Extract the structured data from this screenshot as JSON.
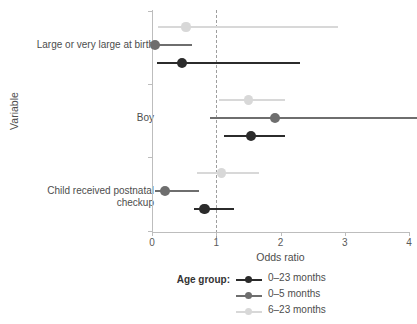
{
  "chart_data": {
    "type": "scatter",
    "title": "",
    "xlabel": "Odds ratio",
    "ylabel": "Variable",
    "xlim": [
      0,
      4.12
    ],
    "xticks": [
      0,
      1,
      2,
      3,
      4
    ],
    "xtick_labels": [
      "0",
      "1",
      "2",
      "3",
      "4"
    ],
    "reference_line": 1,
    "grid": false,
    "legend_position": "bottom",
    "legend_title": "Age group:",
    "categories": [
      "Large or very large at birth",
      "Boy",
      "Child received postnatal checkup"
    ],
    "category_labels": [
      [
        "Large or very large at birth"
      ],
      [
        "Boy"
      ],
      [
        "Child received postnatal",
        "checkup"
      ]
    ],
    "series": [
      {
        "name": "0-23 months",
        "color": "#2b2b2b",
        "estimates": [
          0.47,
          1.54,
          0.82
        ],
        "ci_low": [
          0.08,
          1.12,
          0.65
        ],
        "ci_high": [
          2.31,
          2.07,
          1.27
        ],
        "clipped_high": [
          false,
          false,
          false
        ]
      },
      {
        "name": "0-5 months",
        "color": "#6e6e6e",
        "estimates": [
          0.05,
          1.92,
          0.2
        ],
        "ci_low": [
          0.04,
          0.9,
          0.05
        ],
        "ci_high": [
          0.63,
          4.12,
          0.73
        ],
        "clipped_high": [
          false,
          true,
          false
        ]
      },
      {
        "name": "6-23 months",
        "color": "#d8d8d8",
        "estimates": [
          0.53,
          1.5,
          1.08
        ],
        "ci_low": [
          0.09,
          1.04,
          0.7
        ],
        "ci_high": [
          2.89,
          2.07,
          1.67
        ],
        "clipped_high": [
          false,
          false,
          false
        ]
      }
    ]
  },
  "axes": {
    "x_title": "Odds ratio",
    "y_title": "Variable",
    "xtick_0": "0",
    "xtick_1": "1",
    "xtick_2": "2",
    "xtick_3": "3",
    "xtick_4": "4"
  },
  "y_labels": {
    "cat0_line0": "Large or very large at birth",
    "cat1_line0": "Boy",
    "cat2_line0": "Child received postnatal",
    "cat2_line1": "checkup"
  },
  "legend": {
    "title": "Age group:",
    "items": [
      {
        "label": "0–23 months",
        "color": "#2b2b2b"
      },
      {
        "label": "0–5 months",
        "color": "#6e6e6e"
      },
      {
        "label": "6–23 months",
        "color": "#d8d8d8"
      }
    ]
  },
  "colors": {
    "axis": "#bdbdbd",
    "reference": "#9e9e9e",
    "text": "#4d4d4d",
    "background": "#ffffff"
  }
}
